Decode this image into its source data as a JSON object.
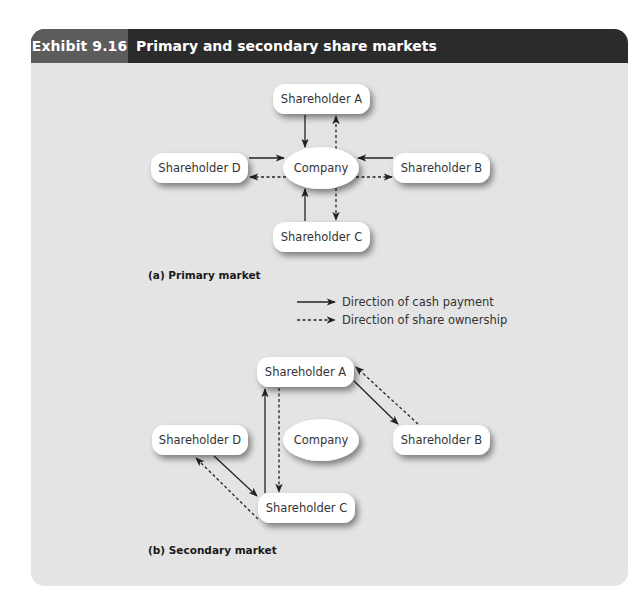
{
  "header": {
    "exhibit_number": "Exhibit 9.16",
    "title": "Primary and secondary share markets"
  },
  "colors": {
    "header_dark": "#2b2b2b",
    "header_label": "#5c5c5c",
    "panel_bg": "#e4e4e4",
    "node_fill": "#ffffff",
    "arrow": "#222222"
  },
  "primary": {
    "caption": "(a) Primary market",
    "nodes": {
      "a": "Shareholder A",
      "b": "Shareholder B",
      "c": "Shareholder C",
      "d": "Shareholder D",
      "company": "Company"
    },
    "edges": [
      {
        "from": "Shareholder A",
        "to": "Company",
        "type": "cash"
      },
      {
        "from": "Company",
        "to": "Shareholder A",
        "type": "shares"
      },
      {
        "from": "Shareholder B",
        "to": "Company",
        "type": "cash"
      },
      {
        "from": "Company",
        "to": "Shareholder B",
        "type": "shares"
      },
      {
        "from": "Shareholder C",
        "to": "Company",
        "type": "cash"
      },
      {
        "from": "Company",
        "to": "Shareholder C",
        "type": "shares"
      },
      {
        "from": "Shareholder D",
        "to": "Company",
        "type": "cash"
      },
      {
        "from": "Company",
        "to": "Shareholder D",
        "type": "shares"
      }
    ]
  },
  "legend": {
    "cash": "Direction of cash payment",
    "shares": "Direction of share ownership"
  },
  "secondary": {
    "caption": "(b) Secondary market",
    "nodes": {
      "a": "Shareholder A",
      "b": "Shareholder B",
      "c": "Shareholder C",
      "d": "Shareholder D",
      "company": "Company"
    },
    "edges": [
      {
        "from": "Shareholder A",
        "to": "Shareholder B",
        "type": "cash"
      },
      {
        "from": "Shareholder B",
        "to": "Shareholder A",
        "type": "shares"
      },
      {
        "from": "Shareholder C",
        "to": "Shareholder A",
        "type": "cash"
      },
      {
        "from": "Shareholder A",
        "to": "Shareholder C",
        "type": "shares"
      },
      {
        "from": "Shareholder D",
        "to": "Shareholder C",
        "type": "cash"
      },
      {
        "from": "Shareholder C",
        "to": "Shareholder D",
        "type": "shares"
      }
    ]
  }
}
